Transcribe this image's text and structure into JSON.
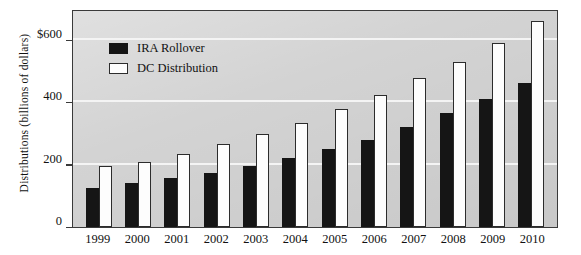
{
  "chart_data": {
    "type": "bar",
    "title": "",
    "xlabel": "",
    "ylabel": "Distributions (billions of dollars)",
    "categories": [
      "1999",
      "2000",
      "2001",
      "2002",
      "2003",
      "2004",
      "2005",
      "2006",
      "2007",
      "2008",
      "2009",
      "2010"
    ],
    "series": [
      {
        "name": "IRA Rollover",
        "values": [
          125,
          142,
          158,
          175,
          197,
          222,
          250,
          280,
          320,
          365,
          410,
          463
        ]
      },
      {
        "name": "DC Distribution",
        "values": [
          196,
          210,
          236,
          265,
          300,
          335,
          380,
          425,
          478,
          530,
          590,
          660
        ]
      }
    ],
    "ylim": [
      0,
      700
    ],
    "yticks": [
      {
        "value": 0,
        "label": "0"
      },
      {
        "value": 200,
        "label": "200"
      },
      {
        "value": 400,
        "label": "400"
      },
      {
        "value": 600,
        "label": "$600"
      }
    ],
    "grid": true,
    "legend_position": "upper-left-inside",
    "colors": {
      "ira_rollover": "#151515",
      "dc_distribution": "#fdfdfd",
      "plot_background": "#d3d3d3",
      "gridline": "#f4f4f4",
      "axis": "#3a3a3a"
    }
  }
}
